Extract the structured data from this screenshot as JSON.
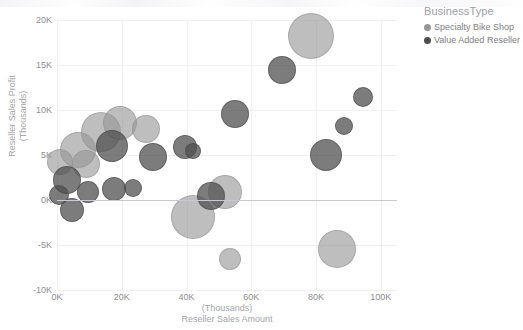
{
  "legend": {
    "title": "BusinessType",
    "items": [
      {
        "label": "Specialty Bike Shop",
        "color": "#969696"
      },
      {
        "label": "Value Added Reseller",
        "color": "#4e4e4e"
      }
    ]
  },
  "axes": {
    "x_title": "Reseller Sales Amount",
    "x_unit": "(Thousands)",
    "y_title": "Reseller Sales Profit",
    "y_unit": "(Thousands)"
  },
  "chart_data": {
    "type": "scatter",
    "title": "",
    "xlabel": "Reseller Sales Amount",
    "ylabel": "Reseller Sales Profit",
    "x_unit": "Thousands",
    "y_unit": "Thousands",
    "xlim": [
      0,
      105
    ],
    "ylim": [
      -10,
      20
    ],
    "xticks": [
      "0K",
      "20K",
      "40K",
      "60K",
      "80K",
      "100K"
    ],
    "xtick_values": [
      0,
      20,
      40,
      60,
      80,
      100
    ],
    "yticks": [
      "20K",
      "15K",
      "10K",
      "5K",
      "0K",
      "-5K",
      "-10K"
    ],
    "ytick_values": [
      20,
      15,
      10,
      5,
      0,
      -5,
      -10
    ],
    "grid": true,
    "zero_line": true,
    "legend_position": "top-right",
    "size_encoding": "bubble area proportional to a third measure",
    "series": [
      {
        "name": "Specialty Bike Shop",
        "color": "#969696",
        "points": [
          {
            "x": 78.5,
            "y": 18.2,
            "r": 23
          },
          {
            "x": 1.0,
            "y": 4.2,
            "r": 13
          },
          {
            "x": 6.5,
            "y": 5.6,
            "r": 18
          },
          {
            "x": 9.0,
            "y": 4.0,
            "r": 14
          },
          {
            "x": 13.5,
            "y": 7.6,
            "r": 20
          },
          {
            "x": 19.5,
            "y": 8.6,
            "r": 17
          },
          {
            "x": 27.5,
            "y": 7.9,
            "r": 14
          },
          {
            "x": 42.0,
            "y": -1.9,
            "r": 22
          },
          {
            "x": 52.0,
            "y": 0.9,
            "r": 17
          },
          {
            "x": 53.5,
            "y": -6.6,
            "r": 11
          },
          {
            "x": 86.5,
            "y": -5.4,
            "r": 19
          }
        ]
      },
      {
        "name": "Value Added Reseller",
        "color": "#4e4e4e",
        "points": [
          {
            "x": 0.6,
            "y": 0.6,
            "r": 10
          },
          {
            "x": 3.0,
            "y": 2.2,
            "r": 14
          },
          {
            "x": 4.5,
            "y": -1.1,
            "r": 12
          },
          {
            "x": 9.5,
            "y": 0.9,
            "r": 11
          },
          {
            "x": 17.0,
            "y": 6.0,
            "r": 16
          },
          {
            "x": 17.5,
            "y": 1.2,
            "r": 12
          },
          {
            "x": 23.5,
            "y": 1.3,
            "r": 9
          },
          {
            "x": 29.5,
            "y": 4.8,
            "r": 14
          },
          {
            "x": 39.5,
            "y": 5.9,
            "r": 12
          },
          {
            "x": 42.0,
            "y": 5.4,
            "r": 8
          },
          {
            "x": 47.5,
            "y": 0.5,
            "r": 14
          },
          {
            "x": 55.0,
            "y": 9.6,
            "r": 14
          },
          {
            "x": 69.5,
            "y": 14.5,
            "r": 14
          },
          {
            "x": 83.0,
            "y": 5.0,
            "r": 16
          },
          {
            "x": 88.5,
            "y": 8.2,
            "r": 9
          },
          {
            "x": 94.5,
            "y": 11.4,
            "r": 10
          }
        ]
      }
    ]
  }
}
